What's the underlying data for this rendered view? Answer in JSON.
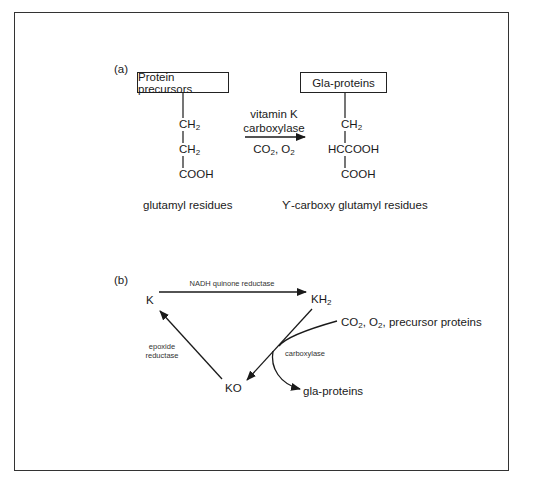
{
  "panel_a": {
    "label": "(a)",
    "left_box": "Protein precursors",
    "right_box": "Gla-proteins",
    "left_chain": {
      "line1_main": "CH",
      "line1_sub": "2",
      "line2_main": "CH",
      "line2_sub": "2",
      "line3": "COOH"
    },
    "right_chain": {
      "line1_main": "CH",
      "line1_sub": "2",
      "line2": "HCCOOH",
      "line3": "COOH"
    },
    "arrow_above_1": "vitamin K",
    "arrow_above_2": "carboxylase",
    "arrow_below": {
      "co": "CO",
      "co_sub": "2",
      "sep": ", O",
      "o_sub": "2"
    },
    "left_caption": "glutamyl residues",
    "right_caption": "ϒ-carboxy glutamyl residues"
  },
  "panel_b": {
    "label": "(b)",
    "node_k": "K",
    "node_kh2": {
      "main": "KH",
      "sub": "2"
    },
    "node_ko": "KO",
    "enzyme_top": "NADH quinone reductase",
    "enzyme_left_1": "epoxide",
    "enzyme_left_2": "reductase",
    "enzyme_right": "carboxylase",
    "inputs": {
      "co": "CO",
      "co_sub": "2",
      "o": ", O",
      "o_sub": "2",
      "rest": ", precursor proteins"
    },
    "output": "gla-proteins"
  },
  "colors": {
    "line": "#1a1a1a",
    "frame": "#333333",
    "background": "#ffffff"
  }
}
